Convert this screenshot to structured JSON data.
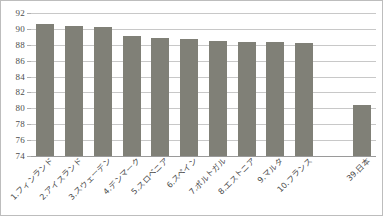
{
  "chart_data": {
    "type": "bar",
    "title": "",
    "xlabel": "",
    "ylabel": "",
    "ylim": [
      74,
      92
    ],
    "ytick_step": 2,
    "yticks": [
      92,
      90,
      88,
      86,
      84,
      82,
      80,
      78,
      76,
      74
    ],
    "grid": true,
    "legend": "none",
    "bar_color": "#808077",
    "categories": [
      "1.フィンランド",
      "2.アイスランド",
      "3.スウェーデン",
      "4.デンマーク",
      "5.スロベニア",
      "6.スペイン",
      "7.ポルトガル",
      "8.エストニア",
      "9.マルタ",
      "10.フランス",
      "",
      "39.日本"
    ],
    "values": [
      90.6,
      90.4,
      90.2,
      89.1,
      88.8,
      88.7,
      88.5,
      88.4,
      88.3,
      88.2,
      null,
      80.4
    ]
  }
}
